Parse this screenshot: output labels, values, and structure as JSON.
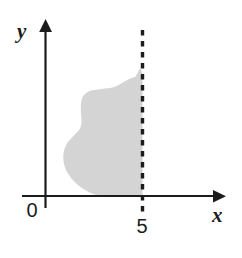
{
  "figure": {
    "name": "shaded-region-graph",
    "background_color": "#ffffff",
    "width": 242,
    "height": 258
  },
  "axes": {
    "x_axis": {
      "label": "x",
      "color": "#1c1c1c",
      "has_arrow": true,
      "arrow_direction": "right"
    },
    "y_axis": {
      "label": "y",
      "color": "#1c1c1c",
      "has_arrow": true,
      "arrow_direction": "up"
    },
    "origin_label": "0"
  },
  "ticks": {
    "x": [
      {
        "label": "5",
        "value": 5
      }
    ]
  },
  "boundary_line": {
    "name": "x-equals-5-dashed-line",
    "label": "5",
    "style": "dashed",
    "color": "#1c1c1c",
    "orientation": "vertical"
  },
  "region": {
    "name": "shaded-region",
    "fill_color": "#d4d4d4",
    "description": "shaded region bounded on the right by the dashed line x = 5 and below by the x-axis"
  },
  "chart_data": {
    "type": "area",
    "title": "",
    "xlabel": "x",
    "ylabel": "y",
    "grid": false,
    "legend": null,
    "xlim": [
      0,
      7.8
    ],
    "ylim": [
      0,
      7.0
    ],
    "xticks": [
      0,
      5
    ],
    "xticklabels": [
      "0",
      "5"
    ],
    "yticks": [],
    "yticklabels": [],
    "annotations": [
      {
        "text": "5",
        "x": 5,
        "y": -0.85
      },
      {
        "text": "0",
        "x": -0.45,
        "y": -0.55
      },
      {
        "text": "x",
        "x": 7.4,
        "y": -0.6
      },
      {
        "text": "y",
        "x": -0.75,
        "y": 6.55
      }
    ],
    "series": [
      {
        "name": "shaded region outer boundary",
        "fill": "#d4d4d4",
        "closed": true,
        "vertices": [
          {
            "x": 5.0,
            "y": 0.0
          },
          {
            "x": 5.0,
            "y": 6.1
          },
          {
            "x": 4.58,
            "y": 6.12
          },
          {
            "x": 4.1,
            "y": 5.92
          },
          {
            "x": 3.55,
            "y": 5.62
          },
          {
            "x": 2.9,
            "y": 5.52
          },
          {
            "x": 2.3,
            "y": 5.42
          },
          {
            "x": 1.9,
            "y": 5.08
          },
          {
            "x": 1.82,
            "y": 4.45
          },
          {
            "x": 1.86,
            "y": 3.82
          },
          {
            "x": 1.74,
            "y": 3.42
          },
          {
            "x": 1.4,
            "y": 3.05
          },
          {
            "x": 1.06,
            "y": 2.62
          },
          {
            "x": 0.92,
            "y": 2.1
          },
          {
            "x": 1.0,
            "y": 1.48
          },
          {
            "x": 1.34,
            "y": 0.9
          },
          {
            "x": 1.86,
            "y": 0.42
          },
          {
            "x": 2.42,
            "y": 0.12
          },
          {
            "x": 3.05,
            "y": 0.0
          }
        ]
      }
    ],
    "dashed_boundary": {
      "name": "x = 5",
      "x": 5,
      "y_from": -0.62,
      "y_to": 6.22,
      "style": "dashed"
    }
  }
}
